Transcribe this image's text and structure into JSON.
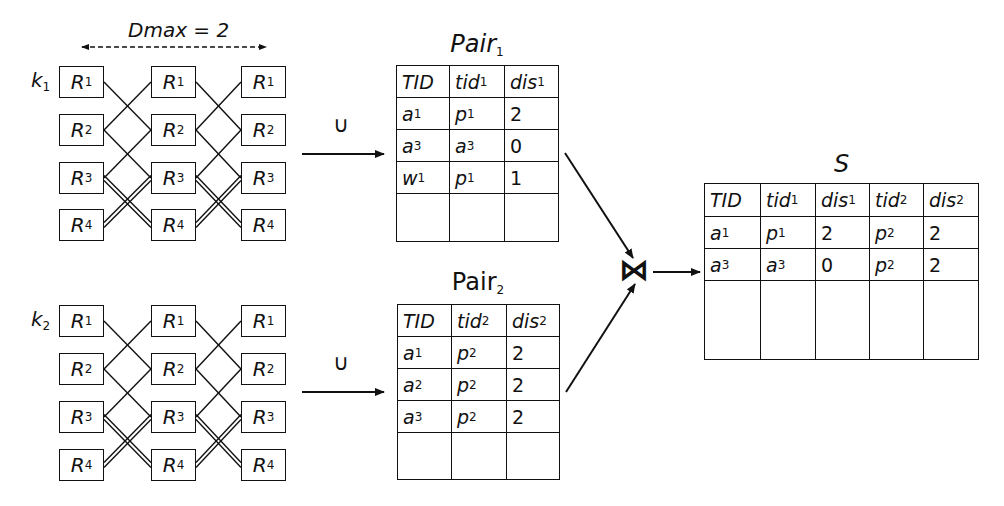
{
  "dmax_label": "Dmax = 2",
  "groups": [
    {
      "key_label": "k",
      "key_sub": "1",
      "columns": 3,
      "rows": [
        {
          "label": "R",
          "sub": "1"
        },
        {
          "label": "R",
          "sub": "2"
        },
        {
          "label": "R",
          "sub": "3"
        },
        {
          "label": "R",
          "sub": "4"
        }
      ]
    },
    {
      "key_label": "k",
      "key_sub": "2",
      "columns": 3,
      "rows": [
        {
          "label": "R",
          "sub": "1"
        },
        {
          "label": "R",
          "sub": "2"
        },
        {
          "label": "R",
          "sub": "3"
        },
        {
          "label": "R",
          "sub": "4"
        }
      ]
    }
  ],
  "union_symbol": "∪",
  "join_symbol": "⋈",
  "pair1": {
    "title": "Pair",
    "title_sub": "1",
    "headers": [
      [
        "TID",
        ""
      ],
      [
        "tid",
        "1"
      ],
      [
        "dis",
        "1"
      ]
    ],
    "rows": [
      [
        [
          "a",
          "1"
        ],
        [
          "p",
          "1"
        ],
        [
          "2",
          ""
        ]
      ],
      [
        [
          "a",
          "3"
        ],
        [
          "a",
          "3"
        ],
        [
          "0",
          ""
        ]
      ],
      [
        [
          "w",
          "1"
        ],
        [
          "p",
          "1"
        ],
        [
          "1",
          ""
        ]
      ],
      [
        [
          "",
          ""
        ],
        [
          "",
          ""
        ],
        [
          "",
          ""
        ]
      ]
    ]
  },
  "pair2": {
    "title": "Pair",
    "title_sub": "2",
    "headers": [
      [
        "TID",
        ""
      ],
      [
        "tid",
        "2"
      ],
      [
        "dis",
        "2"
      ]
    ],
    "rows": [
      [
        [
          "a",
          "1"
        ],
        [
          "p",
          "2"
        ],
        [
          "2",
          ""
        ]
      ],
      [
        [
          "a",
          "2"
        ],
        [
          "p",
          "2"
        ],
        [
          "2",
          ""
        ]
      ],
      [
        [
          "a",
          "3"
        ],
        [
          "p",
          "2"
        ],
        [
          "2",
          ""
        ]
      ],
      [
        [
          "",
          ""
        ],
        [
          "",
          ""
        ],
        [
          "",
          ""
        ]
      ]
    ]
  },
  "result": {
    "title": "S",
    "headers": [
      [
        "TID",
        ""
      ],
      [
        "tid",
        "1"
      ],
      [
        "dis",
        "1"
      ],
      [
        "tid",
        "2"
      ],
      [
        "dis",
        "2"
      ]
    ],
    "rows": [
      [
        [
          "a",
          "1"
        ],
        [
          "p",
          "1"
        ],
        [
          "2",
          ""
        ],
        [
          "p",
          "2"
        ],
        [
          "2",
          ""
        ]
      ],
      [
        [
          "a",
          "3"
        ],
        [
          "a",
          "3"
        ],
        [
          "0",
          ""
        ],
        [
          "p",
          "2"
        ],
        [
          "2",
          ""
        ]
      ],
      [
        [
          "",
          ""
        ],
        [
          "",
          ""
        ],
        [
          "",
          ""
        ],
        [
          "",
          ""
        ],
        [
          "",
          ""
        ]
      ]
    ]
  },
  "colors": {
    "stroke": "#111111",
    "background": "#ffffff"
  }
}
